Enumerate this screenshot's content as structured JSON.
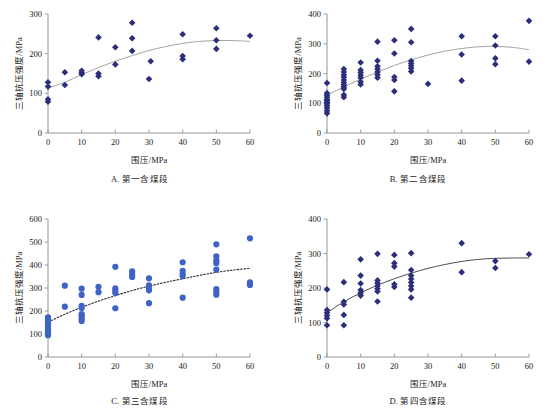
{
  "figure": {
    "marker_color_diamond": "#2b2f7a",
    "marker_color_circle": "#3f63c4",
    "axis_color": "#8a8a8a",
    "trend_color_light": "#9a9a9a",
    "trend_color_dark": "#3a3a3a",
    "xlabel": "围压/MPa",
    "ylabel": "三轴抗压强度/MPa"
  },
  "chart_data": [
    {
      "type": "scatter",
      "panel": "A",
      "caption": "A. 第一含煤段",
      "title": "",
      "xlabel": "围压/MPa",
      "ylabel": "三轴抗压强度/MPa",
      "xlim": [
        0,
        60
      ],
      "ylim": [
        0,
        300
      ],
      "xticks": [
        0,
        10,
        20,
        30,
        40,
        50,
        60
      ],
      "yticks": [
        0,
        100,
        200,
        300
      ],
      "grid": false,
      "legend": "none",
      "marker": "diamond",
      "marker_color": "#2b2f7a",
      "trend_style": "solid",
      "trend_color": "#9a9a9a",
      "points": [
        [
          0,
          79
        ],
        [
          0,
          85
        ],
        [
          0,
          117
        ],
        [
          0,
          128
        ],
        [
          5,
          121
        ],
        [
          5,
          153
        ],
        [
          10,
          148
        ],
        [
          10,
          152
        ],
        [
          10,
          157
        ],
        [
          15,
          143
        ],
        [
          15,
          150
        ],
        [
          15,
          241
        ],
        [
          20,
          173
        ],
        [
          20,
          216
        ],
        [
          25,
          207
        ],
        [
          25,
          239
        ],
        [
          25,
          278
        ],
        [
          30,
          136
        ],
        [
          30.5,
          181
        ],
        [
          40,
          186
        ],
        [
          40,
          194
        ],
        [
          40,
          249
        ],
        [
          50,
          212
        ],
        [
          50,
          234
        ],
        [
          50,
          264
        ],
        [
          60,
          245
        ]
      ],
      "trend": [
        [
          0,
          113
        ],
        [
          5,
          128
        ],
        [
          10,
          147
        ],
        [
          15,
          165
        ],
        [
          20,
          181
        ],
        [
          25,
          195
        ],
        [
          30,
          208
        ],
        [
          35,
          218
        ],
        [
          40,
          226
        ],
        [
          45,
          231
        ],
        [
          50,
          233
        ],
        [
          55,
          233
        ],
        [
          60,
          231
        ]
      ]
    },
    {
      "type": "scatter",
      "panel": "B",
      "caption": "B. 第二含煤段",
      "title": "",
      "xlabel": "围压/MPa",
      "ylabel": "三轴抗压强度/MPa",
      "xlim": [
        0,
        60
      ],
      "ylim": [
        0,
        400
      ],
      "xticks": [
        0,
        10,
        20,
        30,
        40,
        50,
        60
      ],
      "yticks": [
        0,
        100,
        200,
        300,
        400
      ],
      "grid": false,
      "legend": "none",
      "marker": "diamond",
      "marker_color": "#2b2f7a",
      "trend_style": "solid",
      "trend_color": "#9a9a9a",
      "points": [
        [
          0,
          66
        ],
        [
          0,
          75
        ],
        [
          0,
          84
        ],
        [
          0,
          92
        ],
        [
          0,
          98
        ],
        [
          0,
          103
        ],
        [
          0,
          108
        ],
        [
          0,
          113
        ],
        [
          0,
          120
        ],
        [
          0,
          127
        ],
        [
          0,
          134
        ],
        [
          0,
          168
        ],
        [
          5,
          120
        ],
        [
          5,
          128
        ],
        [
          5,
          148
        ],
        [
          5,
          155
        ],
        [
          5,
          162
        ],
        [
          5,
          170
        ],
        [
          5,
          178
        ],
        [
          5,
          188
        ],
        [
          5,
          196
        ],
        [
          5,
          205
        ],
        [
          5,
          215
        ],
        [
          10,
          163
        ],
        [
          10,
          172
        ],
        [
          10,
          186
        ],
        [
          10,
          194
        ],
        [
          10,
          203
        ],
        [
          10,
          212
        ],
        [
          10,
          237
        ],
        [
          15,
          186
        ],
        [
          15,
          196
        ],
        [
          15,
          205
        ],
        [
          15,
          215
        ],
        [
          15,
          224
        ],
        [
          15,
          243
        ],
        [
          15,
          307
        ],
        [
          20,
          140
        ],
        [
          20,
          178
        ],
        [
          20,
          188
        ],
        [
          20,
          267
        ],
        [
          20,
          312
        ],
        [
          25,
          207
        ],
        [
          25,
          218
        ],
        [
          25,
          226
        ],
        [
          25,
          234
        ],
        [
          25,
          242
        ],
        [
          25,
          305
        ],
        [
          25,
          350
        ],
        [
          30,
          165
        ],
        [
          40,
          176
        ],
        [
          40,
          264
        ],
        [
          40,
          325
        ],
        [
          50,
          231
        ],
        [
          50,
          251
        ],
        [
          50,
          294
        ],
        [
          50,
          325
        ],
        [
          60,
          240
        ],
        [
          60,
          377
        ]
      ],
      "trend": [
        [
          0,
          128
        ],
        [
          5,
          155
        ],
        [
          10,
          181
        ],
        [
          15,
          205
        ],
        [
          20,
          227
        ],
        [
          25,
          246
        ],
        [
          30,
          262
        ],
        [
          35,
          275
        ],
        [
          40,
          284
        ],
        [
          45,
          290
        ],
        [
          50,
          291
        ],
        [
          55,
          288
        ],
        [
          60,
          280
        ]
      ]
    },
    {
      "type": "scatter",
      "panel": "C",
      "caption": "C. 第三含煤段",
      "title": "",
      "xlabel": "围压/MPa",
      "ylabel": "三轴抗压强度/MPa",
      "xlim": [
        0,
        60
      ],
      "ylim": [
        0,
        600
      ],
      "xticks": [
        0,
        10,
        20,
        30,
        40,
        50,
        60
      ],
      "yticks": [
        0,
        100,
        200,
        300,
        400,
        500,
        600
      ],
      "grid": false,
      "legend": "none",
      "marker": "circle",
      "marker_color": "#3f63c4",
      "trend_style": "dotted",
      "trend_color": "#2a2a2a",
      "points": [
        [
          0,
          95
        ],
        [
          0,
          103
        ],
        [
          0,
          112
        ],
        [
          0,
          122
        ],
        [
          0,
          132
        ],
        [
          0,
          142
        ],
        [
          0,
          152
        ],
        [
          0,
          162
        ],
        [
          0,
          172
        ],
        [
          5,
          219
        ],
        [
          5,
          310
        ],
        [
          10,
          157
        ],
        [
          10,
          166
        ],
        [
          10,
          176
        ],
        [
          10,
          186
        ],
        [
          10,
          213
        ],
        [
          10,
          222
        ],
        [
          10,
          270
        ],
        [
          10,
          297
        ],
        [
          15,
          282
        ],
        [
          15,
          305
        ],
        [
          20,
          212
        ],
        [
          20,
          278
        ],
        [
          20,
          288
        ],
        [
          20,
          298
        ],
        [
          20,
          392
        ],
        [
          25,
          348
        ],
        [
          25,
          360
        ],
        [
          25,
          372
        ],
        [
          30,
          234
        ],
        [
          30,
          290
        ],
        [
          30,
          300
        ],
        [
          30,
          312
        ],
        [
          30,
          342
        ],
        [
          40,
          258
        ],
        [
          40,
          352
        ],
        [
          40,
          362
        ],
        [
          40,
          375
        ],
        [
          40,
          412
        ],
        [
          50,
          271
        ],
        [
          50,
          283
        ],
        [
          50,
          295
        ],
        [
          50,
          380
        ],
        [
          50,
          408
        ],
        [
          50,
          420
        ],
        [
          50,
          438
        ],
        [
          50,
          490
        ],
        [
          60,
          313
        ],
        [
          60,
          325
        ],
        [
          60,
          516
        ]
      ],
      "trend": [
        [
          0,
          152
        ],
        [
          5,
          186
        ],
        [
          10,
          216
        ],
        [
          15,
          243
        ],
        [
          20,
          267
        ],
        [
          25,
          289
        ],
        [
          30,
          308
        ],
        [
          35,
          325
        ],
        [
          40,
          340
        ],
        [
          45,
          355
        ],
        [
          50,
          368
        ],
        [
          55,
          378
        ],
        [
          60,
          386
        ]
      ]
    },
    {
      "type": "scatter",
      "panel": "D",
      "caption": "D. 第四含煤段",
      "title": "",
      "xlabel": "围压/MPa",
      "ylabel": "三轴抗压强度/MPa",
      "xlim": [
        0,
        60
      ],
      "ylim": [
        0,
        400
      ],
      "xticks": [
        0,
        10,
        20,
        30,
        40,
        50,
        60
      ],
      "yticks": [
        0,
        100,
        200,
        300,
        400
      ],
      "grid": false,
      "legend": "none",
      "marker": "diamond",
      "marker_color": "#2b2f7a",
      "trend_style": "solid-dark",
      "trend_color": "#3a3a3a",
      "points": [
        [
          0,
          92
        ],
        [
          0,
          112
        ],
        [
          0,
          120
        ],
        [
          0,
          128
        ],
        [
          0,
          136
        ],
        [
          0,
          196
        ],
        [
          5,
          92
        ],
        [
          5,
          122
        ],
        [
          5,
          152
        ],
        [
          5,
          160
        ],
        [
          5,
          217
        ],
        [
          10,
          178
        ],
        [
          10,
          186
        ],
        [
          10,
          194
        ],
        [
          10,
          213
        ],
        [
          10,
          236
        ],
        [
          10,
          283
        ],
        [
          15,
          161
        ],
        [
          15,
          190
        ],
        [
          15,
          198
        ],
        [
          15,
          206
        ],
        [
          15,
          214
        ],
        [
          15,
          222
        ],
        [
          15,
          299
        ],
        [
          20,
          203
        ],
        [
          20,
          211
        ],
        [
          20,
          262
        ],
        [
          20,
          272
        ],
        [
          20,
          296
        ],
        [
          25,
          172
        ],
        [
          25,
          196
        ],
        [
          25,
          206
        ],
        [
          25,
          216
        ],
        [
          25,
          226
        ],
        [
          25,
          236
        ],
        [
          25,
          252
        ],
        [
          25,
          301
        ],
        [
          40,
          246
        ],
        [
          40,
          330
        ],
        [
          50,
          258
        ],
        [
          50,
          278
        ],
        [
          60,
          298
        ]
      ],
      "trend": [
        [
          0,
          128
        ],
        [
          5,
          160
        ],
        [
          10,
          186
        ],
        [
          15,
          208
        ],
        [
          20,
          227
        ],
        [
          25,
          243
        ],
        [
          30,
          257
        ],
        [
          35,
          268
        ],
        [
          40,
          277
        ],
        [
          45,
          283
        ],
        [
          50,
          286
        ],
        [
          55,
          287
        ],
        [
          60,
          287
        ]
      ]
    }
  ]
}
